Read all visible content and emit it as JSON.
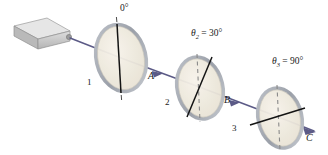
{
  "figure": {
    "type": "optics-diagram",
    "background": "#ffffff",
    "beam_color": "#5b5a86",
    "axis_color": "#141414",
    "dashed_color": "#8a8a8a",
    "disc_fill": "#efeade",
    "disc_rim": "#a8acb4"
  },
  "source": {
    "name": "light-source",
    "body_color": "#cdcdcd",
    "top_color": "#e2e2e2",
    "side_color": "#a9a9a9"
  },
  "polarizers": [
    {
      "id": "1",
      "number_label": "1",
      "angle_label": "0°",
      "angle_label_prefix": "",
      "angle_value": 0,
      "axis_tilt_deg": 0,
      "has_dashed_reference": false
    },
    {
      "id": "2",
      "number_label": "2",
      "angle_label": "= 30°",
      "angle_label_prefix": "θ",
      "angle_label_subscript": "2",
      "angle_value": 30,
      "axis_tilt_deg": 30,
      "has_dashed_reference": true
    },
    {
      "id": "3",
      "number_label": "3",
      "angle_label": "= 90°",
      "angle_label_prefix": "θ",
      "angle_label_subscript": "3",
      "angle_value": 90,
      "axis_tilt_deg": 90,
      "has_dashed_reference": true
    }
  ],
  "beam_segments": [
    {
      "id": "A",
      "label": "A"
    },
    {
      "id": "B",
      "label": "B"
    },
    {
      "id": "C",
      "label": "C"
    }
  ]
}
